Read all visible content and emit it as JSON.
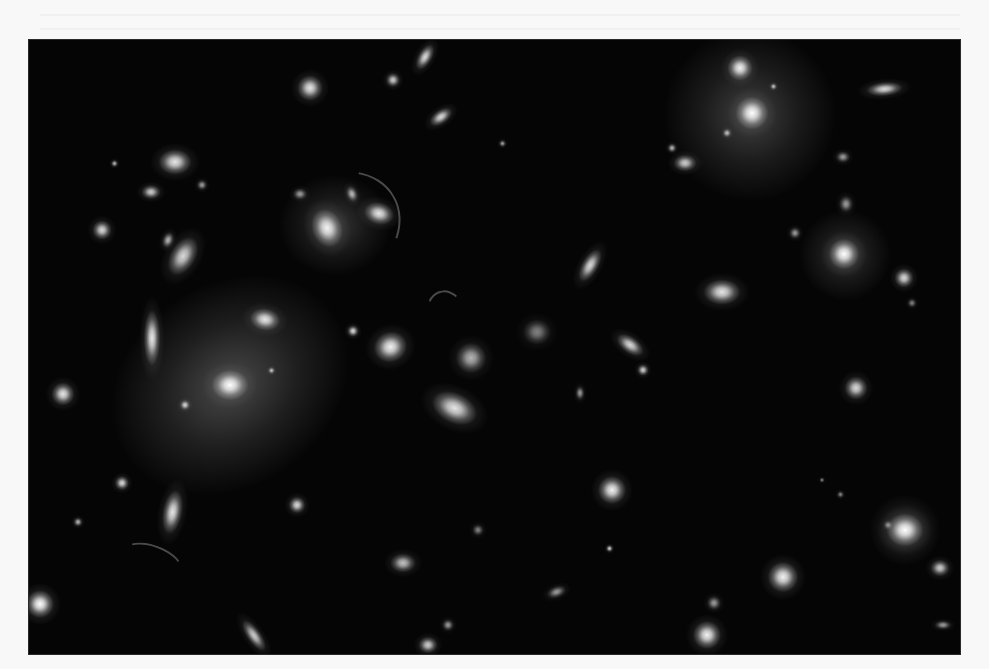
{
  "page": {
    "background": "#f8f8f8"
  },
  "photo": {
    "description": "Grayscale deep-field image of a galaxy cluster with numerous elliptical and spiral galaxies and faint lensing arcs",
    "frame": {
      "x": 29,
      "y": 40,
      "width": 931,
      "height": 614
    },
    "background": "#050505",
    "halos": [
      {
        "x": 230,
        "y": 385,
        "w": 250,
        "h": 200,
        "rot": -35,
        "intensity": 0.35
      },
      {
        "x": 750,
        "y": 115,
        "w": 170,
        "h": 170,
        "rot": 0,
        "intensity": 0.3
      },
      {
        "x": 335,
        "y": 225,
        "w": 110,
        "h": 100,
        "rot": 0,
        "intensity": 0.25
      },
      {
        "x": 845,
        "y": 255,
        "w": 90,
        "h": 90,
        "rot": 0,
        "intensity": 0.25
      },
      {
        "x": 905,
        "y": 530,
        "w": 70,
        "h": 70,
        "rot": 0,
        "intensity": 0.25
      }
    ],
    "galaxies": [
      {
        "x": 230,
        "y": 385,
        "w": 26,
        "h": 22,
        "rot": 0,
        "b": 1.0
      },
      {
        "x": 752,
        "y": 113,
        "w": 24,
        "h": 24,
        "rot": 0,
        "b": 1.0
      },
      {
        "x": 740,
        "y": 68,
        "w": 18,
        "h": 18,
        "rot": 0,
        "b": 0.95
      },
      {
        "x": 327,
        "y": 228,
        "w": 22,
        "h": 28,
        "rot": -20,
        "b": 0.95
      },
      {
        "x": 379,
        "y": 214,
        "w": 22,
        "h": 16,
        "rot": 15,
        "b": 0.9
      },
      {
        "x": 352,
        "y": 194,
        "w": 8,
        "h": 12,
        "rot": -20,
        "b": 0.7
      },
      {
        "x": 300,
        "y": 194,
        "w": 10,
        "h": 8,
        "rot": 0,
        "b": 0.6
      },
      {
        "x": 844,
        "y": 254,
        "w": 22,
        "h": 22,
        "rot": 0,
        "b": 1.0
      },
      {
        "x": 904,
        "y": 278,
        "w": 14,
        "h": 14,
        "rot": 0,
        "b": 0.85
      },
      {
        "x": 846,
        "y": 204,
        "w": 10,
        "h": 12,
        "rot": 0,
        "b": 0.6
      },
      {
        "x": 795,
        "y": 233,
        "w": 8,
        "h": 8,
        "rot": 0,
        "b": 0.6
      },
      {
        "x": 905,
        "y": 530,
        "w": 26,
        "h": 24,
        "rot": 0,
        "b": 1.0
      },
      {
        "x": 265,
        "y": 320,
        "w": 22,
        "h": 16,
        "rot": 10,
        "b": 0.9
      },
      {
        "x": 152,
        "y": 338,
        "w": 12,
        "h": 40,
        "rot": 0,
        "b": 0.9
      },
      {
        "x": 390,
        "y": 347,
        "w": 24,
        "h": 22,
        "rot": -20,
        "b": 0.95
      },
      {
        "x": 353,
        "y": 331,
        "w": 8,
        "h": 8,
        "rot": 0,
        "b": 0.85
      },
      {
        "x": 185,
        "y": 405,
        "w": 7,
        "h": 7,
        "rot": 0,
        "b": 0.8
      },
      {
        "x": 271,
        "y": 370,
        "w": 5,
        "h": 5,
        "rot": 0,
        "b": 0.7
      },
      {
        "x": 175,
        "y": 162,
        "w": 24,
        "h": 18,
        "rot": 0,
        "b": 0.9
      },
      {
        "x": 151,
        "y": 192,
        "w": 14,
        "h": 10,
        "rot": 0,
        "b": 0.8
      },
      {
        "x": 102,
        "y": 230,
        "w": 14,
        "h": 14,
        "rot": 0,
        "b": 0.85
      },
      {
        "x": 183,
        "y": 256,
        "w": 18,
        "h": 30,
        "rot": 30,
        "b": 0.85
      },
      {
        "x": 168,
        "y": 240,
        "w": 8,
        "h": 12,
        "rot": 20,
        "b": 0.7
      },
      {
        "x": 114,
        "y": 163,
        "w": 5,
        "h": 5,
        "rot": 0,
        "b": 0.7
      },
      {
        "x": 202,
        "y": 185,
        "w": 7,
        "h": 7,
        "rot": 0,
        "b": 0.6
      },
      {
        "x": 63,
        "y": 394,
        "w": 16,
        "h": 16,
        "rot": 0,
        "b": 0.9
      },
      {
        "x": 40,
        "y": 604,
        "w": 20,
        "h": 20,
        "rot": 0,
        "b": 1.0
      },
      {
        "x": 172,
        "y": 512,
        "w": 14,
        "h": 32,
        "rot": 10,
        "b": 0.9
      },
      {
        "x": 122,
        "y": 483,
        "w": 10,
        "h": 10,
        "rot": 0,
        "b": 0.85
      },
      {
        "x": 297,
        "y": 505,
        "w": 12,
        "h": 12,
        "rot": 0,
        "b": 0.85
      },
      {
        "x": 78,
        "y": 522,
        "w": 6,
        "h": 6,
        "rot": 0,
        "b": 0.7
      },
      {
        "x": 254,
        "y": 636,
        "w": 10,
        "h": 26,
        "rot": -35,
        "b": 0.8
      },
      {
        "x": 310,
        "y": 88,
        "w": 18,
        "h": 18,
        "rot": 0,
        "b": 0.9
      },
      {
        "x": 393,
        "y": 80,
        "w": 10,
        "h": 10,
        "rot": 0,
        "b": 0.8
      },
      {
        "x": 425,
        "y": 57,
        "w": 10,
        "h": 20,
        "rot": 30,
        "b": 0.85
      },
      {
        "x": 441,
        "y": 117,
        "w": 18,
        "h": 10,
        "rot": -35,
        "b": 0.85
      },
      {
        "x": 502,
        "y": 143,
        "w": 5,
        "h": 5,
        "rot": 0,
        "b": 0.6
      },
      {
        "x": 454,
        "y": 408,
        "w": 34,
        "h": 22,
        "rot": 25,
        "b": 0.9
      },
      {
        "x": 471,
        "y": 358,
        "w": 22,
        "h": 22,
        "rot": 0,
        "b": 0.7
      },
      {
        "x": 537,
        "y": 332,
        "w": 20,
        "h": 18,
        "rot": 0,
        "b": 0.5
      },
      {
        "x": 630,
        "y": 345,
        "w": 22,
        "h": 12,
        "rot": 35,
        "b": 0.85
      },
      {
        "x": 643,
        "y": 370,
        "w": 8,
        "h": 8,
        "rot": 0,
        "b": 0.8
      },
      {
        "x": 580,
        "y": 393,
        "w": 6,
        "h": 10,
        "rot": 0,
        "b": 0.6
      },
      {
        "x": 590,
        "y": 266,
        "w": 12,
        "h": 26,
        "rot": 30,
        "b": 0.85
      },
      {
        "x": 722,
        "y": 292,
        "w": 26,
        "h": 18,
        "rot": 0,
        "b": 0.9
      },
      {
        "x": 685,
        "y": 163,
        "w": 16,
        "h": 12,
        "rot": 0,
        "b": 0.8
      },
      {
        "x": 672,
        "y": 148,
        "w": 6,
        "h": 6,
        "rot": 0,
        "b": 0.7
      },
      {
        "x": 885,
        "y": 89,
        "w": 26,
        "h": 10,
        "rot": -5,
        "b": 0.85
      },
      {
        "x": 843,
        "y": 157,
        "w": 10,
        "h": 8,
        "rot": 0,
        "b": 0.6
      },
      {
        "x": 727,
        "y": 133,
        "w": 6,
        "h": 6,
        "rot": 0,
        "b": 0.7
      },
      {
        "x": 773,
        "y": 86,
        "w": 5,
        "h": 5,
        "rot": 0,
        "b": 0.7
      },
      {
        "x": 856,
        "y": 388,
        "w": 16,
        "h": 16,
        "rot": 0,
        "b": 0.85
      },
      {
        "x": 612,
        "y": 490,
        "w": 20,
        "h": 20,
        "rot": 0,
        "b": 0.95
      },
      {
        "x": 783,
        "y": 577,
        "w": 22,
        "h": 22,
        "rot": 0,
        "b": 0.95
      },
      {
        "x": 707,
        "y": 635,
        "w": 20,
        "h": 20,
        "rot": 0,
        "b": 0.95
      },
      {
        "x": 714,
        "y": 603,
        "w": 10,
        "h": 10,
        "rot": 0,
        "b": 0.6
      },
      {
        "x": 609,
        "y": 548,
        "w": 5,
        "h": 5,
        "rot": 0,
        "b": 0.8
      },
      {
        "x": 556,
        "y": 592,
        "w": 14,
        "h": 8,
        "rot": -20,
        "b": 0.6
      },
      {
        "x": 403,
        "y": 563,
        "w": 18,
        "h": 14,
        "rot": 0,
        "b": 0.75
      },
      {
        "x": 478,
        "y": 530,
        "w": 8,
        "h": 8,
        "rot": 0,
        "b": 0.5
      },
      {
        "x": 428,
        "y": 645,
        "w": 14,
        "h": 12,
        "rot": 0,
        "b": 0.8
      },
      {
        "x": 448,
        "y": 625,
        "w": 8,
        "h": 8,
        "rot": 0,
        "b": 0.6
      },
      {
        "x": 940,
        "y": 568,
        "w": 14,
        "h": 12,
        "rot": 0,
        "b": 0.8
      },
      {
        "x": 888,
        "y": 525,
        "w": 6,
        "h": 6,
        "rot": 0,
        "b": 0.5
      },
      {
        "x": 943,
        "y": 625,
        "w": 12,
        "h": 6,
        "rot": 0,
        "b": 0.6
      },
      {
        "x": 840,
        "y": 494,
        "w": 5,
        "h": 5,
        "rot": 0,
        "b": 0.5
      },
      {
        "x": 912,
        "y": 303,
        "w": 6,
        "h": 6,
        "rot": 0,
        "b": 0.5
      },
      {
        "x": 822,
        "y": 480,
        "w": 4,
        "h": 4,
        "rot": 0,
        "b": 0.5
      }
    ],
    "arcs": [
      {
        "x": 330,
        "y": 230,
        "w": 110,
        "h": 140,
        "rot": 60
      },
      {
        "x": 445,
        "y": 320,
        "w": 40,
        "h": 60,
        "rot": -10
      },
      {
        "x": 150,
        "y": 560,
        "w": 60,
        "h": 30,
        "rot": 20
      },
      {
        "x": 660,
        "y": 40,
        "w": 80,
        "h": 120,
        "rot": -30
      }
    ]
  }
}
